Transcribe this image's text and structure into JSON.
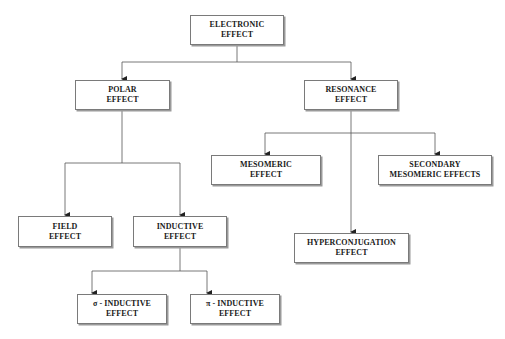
{
  "diagram": {
    "type": "hierarchy-tree",
    "nodes": {
      "electronic": {
        "line1": "ELECTRONIC",
        "line2": "EFFECT"
      },
      "polar": {
        "line1": "POLAR",
        "line2": "EFFECT"
      },
      "resonance": {
        "line1": "RESONANCE",
        "line2": "EFFECT"
      },
      "field": {
        "line1": "FIELD",
        "line2": "EFFECT"
      },
      "inductive": {
        "line1": "INDUCTIVE",
        "line2": "EFFECT"
      },
      "mesomeric": {
        "line1": "MESOMERIC",
        "line2": "EFFECT"
      },
      "hyperconjugation": {
        "line1": "HYPERCONJUGATION",
        "line2": "EFFECT"
      },
      "secondary_mesomeric": {
        "line1": "SECONDARY",
        "line2": "MESOMERIC EFFECTS"
      },
      "sigma_inductive": {
        "line1": "σ - INDUCTIVE",
        "line2": "EFFECT"
      },
      "pi_inductive": {
        "line1": "π - INDUCTIVE",
        "line2": "EFFECT"
      }
    },
    "edges": [
      [
        "ELECTRONIC EFFECT",
        "POLAR EFFECT"
      ],
      [
        "ELECTRONIC EFFECT",
        "RESONANCE EFFECT"
      ],
      [
        "POLAR EFFECT",
        "FIELD EFFECT"
      ],
      [
        "POLAR EFFECT",
        "INDUCTIVE EFFECT"
      ],
      [
        "RESONANCE EFFECT",
        "MESOMERIC EFFECT"
      ],
      [
        "RESONANCE EFFECT",
        "HYPERCONJUGATION EFFECT"
      ],
      [
        "RESONANCE EFFECT",
        "SECONDARY MESOMERIC EFFECTS"
      ],
      [
        "INDUCTIVE EFFECT",
        "σ - INDUCTIVE EFFECT"
      ],
      [
        "INDUCTIVE EFFECT",
        "π - INDUCTIVE EFFECT"
      ]
    ],
    "colors": {
      "line": "#555555",
      "border": "#7a7a7a",
      "text": "#1a1a1a"
    }
  }
}
